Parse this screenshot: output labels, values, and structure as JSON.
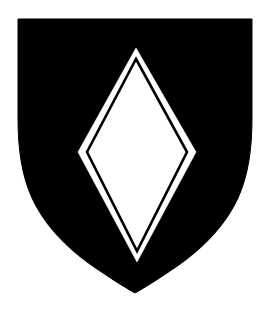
{
  "image": {
    "kind": "heraldic-achievement",
    "title": "Sable, a lozenge voided argent",
    "width": 260,
    "height": 315,
    "background_color": "#ffffff"
  },
  "shield": {
    "name": "escutcheon",
    "tincture_name": "sable",
    "field_color": "#000000",
    "outline_color": "#000000",
    "geometry": {
      "top_left_x": 18,
      "top_right_x": 252,
      "top_y": 19,
      "point_x": 135,
      "point_y": 293,
      "flank_straight_until_y": 118,
      "widest_left_x": 18,
      "widest_right_x": 252
    },
    "path": "M 18 19 L 252 19 L 252 120 C 252 196 216 256 135 293 C 54 256 18 196 18 120 Z"
  },
  "charge": {
    "name": "lozenge-voided",
    "blazon_term": "lozenge voided",
    "tincture_name": "argent",
    "fill_color": "#ffffff",
    "void_color": "#000000",
    "outer": {
      "top": [
        136,
        48
      ],
      "left": [
        78,
        152
      ],
      "right": [
        196,
        152
      ],
      "bottom": [
        137,
        262
      ],
      "path": "M 136 48 L 196 152 L 137 262 L 78 152 Z"
    },
    "void_line": {
      "stroke_width": 2.6,
      "inset": 5.5,
      "top": [
        136,
        59
      ],
      "left": [
        87,
        152
      ],
      "right": [
        187,
        152
      ],
      "bottom": [
        137,
        251
      ],
      "path": "M 136 59 L 187 152 L 137 251 L 87 152 Z"
    },
    "interior": {
      "fill_color": "#ffffff",
      "path": "M 136 63 L 184 152 L 137 247 L 90 152 Z"
    }
  },
  "palette": {
    "sable": "#000000",
    "argent": "#ffffff",
    "paper": "#ffffff"
  }
}
